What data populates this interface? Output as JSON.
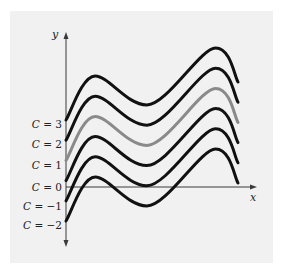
{
  "chart_data": {
    "type": "line",
    "title": "",
    "xlabel": "x",
    "ylabel": "y",
    "grid": false,
    "legend": "none; curves labeled at left edge of y-axis",
    "curve_shape": {
      "x": [
        0,
        0.17,
        0.47,
        0.87,
        1.0
      ],
      "relative_y": [
        0,
        2.2,
        0.75,
        3.6,
        1.9
      ],
      "notes": "starts at C, rises to local max, dips to local min, rises to higher max, falls at right end"
    },
    "series": [
      {
        "name": "C = 3",
        "C": 3,
        "color": "#111111"
      },
      {
        "name": "C = 2",
        "C": 2,
        "color": "#111111"
      },
      {
        "name": "C = 1",
        "C": 1,
        "color": "#8a8a8a"
      },
      {
        "name": "C = 0",
        "C": 0,
        "color": "#111111"
      },
      {
        "name": "C = −1",
        "C": -1,
        "color": "#111111"
      },
      {
        "name": "C = −2",
        "C": -2,
        "color": "#111111"
      }
    ],
    "highlighted_series": "C = 1"
  },
  "axes": {
    "x_label": "x",
    "y_label": "y"
  },
  "labels": [
    {
      "var": "C",
      "text": " = 3"
    },
    {
      "var": "C",
      "text": " = 2"
    },
    {
      "var": "C",
      "text": " = 1"
    },
    {
      "var": "C",
      "text": " = 0"
    },
    {
      "var": "C",
      "text": " = −1"
    },
    {
      "var": "C",
      "text": " = −2"
    }
  ],
  "colors": {
    "panel": "#f1f1f1",
    "curve": "#111111",
    "highlight_curve": "#8a8a8a",
    "axis": "#3a3a3a"
  }
}
